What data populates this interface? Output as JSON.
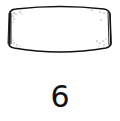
{
  "figure": {
    "shape": "barrel-bead-outline",
    "label": "6",
    "colors": {
      "stroke": "#111111",
      "background": "#ffffff",
      "stipple": "#333333"
    }
  }
}
